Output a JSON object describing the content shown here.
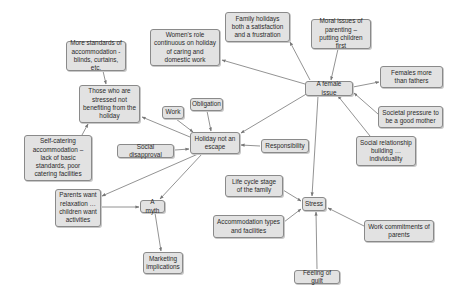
{
  "diagram": {
    "type": "concept-map",
    "colors": {
      "node_fill": "#e2e2e2",
      "node_border": "#8a8a8a",
      "edge": "#777777",
      "text": "#2a2a2a"
    },
    "nodes": [
      {
        "id": "more_standards",
        "label": "More standards of accommodation - blinds, curtains, etc.",
        "x": 66,
        "y": 41,
        "w": 60,
        "h": 30
      },
      {
        "id": "stressed",
        "label": "Those who are stressed not benefiting from the holiday",
        "x": 79,
        "y": 85,
        "w": 61,
        "h": 38
      },
      {
        "id": "womens_role",
        "label": "Women's role continuous on holiday of caring and domestic work",
        "x": 150,
        "y": 29,
        "w": 70,
        "h": 37
      },
      {
        "id": "family_holidays",
        "label": "Family holidays both a satisfaction and a frustration",
        "x": 225,
        "y": 12,
        "w": 65,
        "h": 30
      },
      {
        "id": "moral_issues",
        "label": "Moral issues of parenting – putting children first",
        "x": 311,
        "y": 19,
        "w": 60,
        "h": 30
      },
      {
        "id": "female_issue",
        "label": "A female issue",
        "x": 305,
        "y": 81,
        "w": 48,
        "h": 15
      },
      {
        "id": "females_more",
        "label": "Females more than fathers",
        "x": 380,
        "y": 66,
        "w": 63,
        "h": 22
      },
      {
        "id": "societal_pressure",
        "label": "Societal pressure to be a good mother",
        "x": 378,
        "y": 106,
        "w": 65,
        "h": 22
      },
      {
        "id": "social_relationship",
        "label": "Social relationship building … individuality",
        "x": 356,
        "y": 136,
        "w": 60,
        "h": 30
      },
      {
        "id": "work",
        "label": "Work",
        "x": 162,
        "y": 106,
        "w": 22,
        "h": 13
      },
      {
        "id": "obligation",
        "label": "Obligation",
        "x": 190,
        "y": 98,
        "w": 33,
        "h": 13
      },
      {
        "id": "holiday_not_escape",
        "label": "Holiday not an escape",
        "x": 190,
        "y": 132,
        "w": 50,
        "h": 22
      },
      {
        "id": "responsibility",
        "label": "Responsibility",
        "x": 261,
        "y": 139,
        "w": 48,
        "h": 14
      },
      {
        "id": "social_disapproval",
        "label": "Social disapproval",
        "x": 117,
        "y": 144,
        "w": 57,
        "h": 14
      },
      {
        "id": "self_catering",
        "label": "Self-catering accommodation – lack of basic standards, poor catering facilities",
        "x": 24,
        "y": 135,
        "w": 68,
        "h": 46
      },
      {
        "id": "parents_want",
        "label": "Parents want relaxation … children want activities",
        "x": 55,
        "y": 189,
        "w": 46,
        "h": 38
      },
      {
        "id": "a_myth",
        "label": "A myth",
        "x": 140,
        "y": 200,
        "w": 25,
        "h": 13
      },
      {
        "id": "marketing",
        "label": "Marketing implications",
        "x": 143,
        "y": 252,
        "w": 40,
        "h": 22
      },
      {
        "id": "life_cycle",
        "label": "Life cycle stage of the family",
        "x": 225,
        "y": 175,
        "w": 58,
        "h": 22
      },
      {
        "id": "stress",
        "label": "Stress",
        "x": 302,
        "y": 197,
        "w": 24,
        "h": 14
      },
      {
        "id": "accommodation_types",
        "label": "Accommodation types and facilities",
        "x": 213,
        "y": 215,
        "w": 71,
        "h": 23
      },
      {
        "id": "work_commitments",
        "label": "Work commitments of parents",
        "x": 364,
        "y": 220,
        "w": 70,
        "h": 22
      },
      {
        "id": "feeling_guilt",
        "label": "Feeling of guilt",
        "x": 294,
        "y": 270,
        "w": 46,
        "h": 14
      }
    ],
    "edges": [
      {
        "from": [
          103,
          71
        ],
        "to": [
          106,
          84
        ]
      },
      {
        "from": [
          82,
          135
        ],
        "to": [
          88,
          124
        ]
      },
      {
        "from": [
          305,
          84
        ],
        "to": [
          222,
          60
        ]
      },
      {
        "from": [
          310,
          80
        ],
        "to": [
          290,
          42
        ]
      },
      {
        "from": [
          338,
          49
        ],
        "to": [
          331,
          80
        ]
      },
      {
        "from": [
          353,
          87
        ],
        "to": [
          379,
          82
        ]
      },
      {
        "from": [
          378,
          114
        ],
        "to": [
          354,
          93
        ]
      },
      {
        "from": [
          370,
          136
        ],
        "to": [
          338,
          96
        ]
      },
      {
        "from": [
          318,
          96
        ],
        "to": [
          312,
          196
        ]
      },
      {
        "from": [
          308,
          93
        ],
        "to": [
          241,
          133
        ]
      },
      {
        "from": [
          176,
          119
        ],
        "to": [
          193,
          132
        ]
      },
      {
        "from": [
          207,
          111
        ],
        "to": [
          211,
          131
        ]
      },
      {
        "from": [
          260,
          146
        ],
        "to": [
          241,
          145
        ]
      },
      {
        "from": [
          175,
          150
        ],
        "to": [
          189,
          149
        ]
      },
      {
        "from": [
          190,
          137
        ],
        "to": [
          142,
          117
        ]
      },
      {
        "from": [
          198,
          154
        ],
        "to": [
          102,
          196
        ]
      },
      {
        "from": [
          202,
          154
        ],
        "to": [
          160,
          199
        ]
      },
      {
        "from": [
          101,
          207
        ],
        "to": [
          139,
          207
        ]
      },
      {
        "from": [
          155,
          213
        ],
        "to": [
          161,
          251
        ]
      },
      {
        "from": [
          283,
          190
        ],
        "to": [
          301,
          201
        ]
      },
      {
        "from": [
          284,
          222
        ],
        "to": [
          301,
          209
        ]
      },
      {
        "from": [
          364,
          226
        ],
        "to": [
          328,
          208
        ]
      },
      {
        "from": [
          317,
          269
        ],
        "to": [
          316,
          212
        ]
      }
    ]
  }
}
